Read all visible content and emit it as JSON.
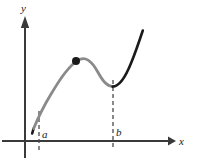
{
  "figure": {
    "background_color": "#ffffff",
    "width": 201,
    "height": 162
  },
  "axes": {
    "x_axis": {
      "label": "x",
      "label_x": 181,
      "label_y": 143,
      "line_color": "#3a3a3a",
      "y_position": 141,
      "x_start": 2,
      "x_end": 170,
      "arrow": "right"
    },
    "y_axis": {
      "label": "y",
      "label_x": 22,
      "label_y": 11,
      "line_color": "#3a3a3a",
      "x_position": 25,
      "y_start": 158,
      "y_end": 17,
      "arrow": "up"
    }
  },
  "markers": {
    "a": {
      "label": "a",
      "tick_x": 39,
      "tick_top": 111,
      "tick_bottom": 150,
      "label_x": 43,
      "label_y": 138,
      "style": "dashed"
    },
    "b": {
      "label": "b",
      "tick_x": 113,
      "tick_top": 80,
      "tick_bottom": 150,
      "label_x": 117,
      "label_y": 136,
      "style": "dashed"
    }
  },
  "curve": {
    "gray_color": "#8a8a8a",
    "black_color": "#1a1a1a",
    "stroke_width": 2.6,
    "segment_gray_path": "M 33.5 129 C 38 118 43 106 50 95 C 57.5 83 65 70 76 61.5 C 85 54.5 92 62 97 71 C 102 80 106.5 86 113 86.5",
    "segment_black_left_path": "M 32.5 132.5 C 33 131 33.2 130 33.7 128.6",
    "segment_black_right_path": "M 113 86.5 C 120 86.5 126 76 131.5 62 C 136 51 139.5 39 142.5 30.5"
  },
  "dot": {
    "name": "local-maximum-point",
    "cx": 76,
    "cy": 61,
    "r": 4,
    "color": "#1a1a1a"
  }
}
